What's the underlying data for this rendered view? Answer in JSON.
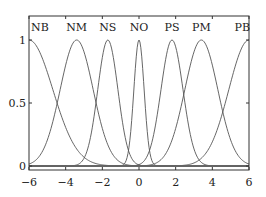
{
  "chart_data": {
    "type": "line",
    "title": "",
    "xlabel": "",
    "ylabel": "",
    "xlim": [
      -6,
      6
    ],
    "ylim": [
      0,
      1.07
    ],
    "grid": false,
    "legend": "none",
    "x_ticks": [
      -6,
      -4,
      -2,
      0,
      2,
      4,
      6
    ],
    "x_tick_labels": [
      "−6",
      "−4",
      "−2",
      "0",
      "2",
      "4",
      "6"
    ],
    "y_ticks": [
      0,
      0.5,
      1
    ],
    "y_tick_labels": [
      "0",
      "0.5",
      "1"
    ],
    "line_color": "#555555",
    "series": [
      {
        "name": "NB",
        "center": -6.0,
        "sigma": 1.3
      },
      {
        "name": "NM",
        "center": -3.4,
        "sigma": 0.9
      },
      {
        "name": "NS",
        "center": -1.7,
        "sigma": 0.55
      },
      {
        "name": "NO",
        "center": 0.0,
        "sigma": 0.28
      },
      {
        "name": "PS",
        "center": 1.8,
        "sigma": 0.6
      },
      {
        "name": "PM",
        "center": 3.4,
        "sigma": 0.9
      },
      {
        "name": "PB",
        "center": 6.0,
        "sigma": 1.1
      }
    ],
    "top_labels": [
      {
        "text": "NB",
        "x": -6.0
      },
      {
        "text": "NM",
        "x": -3.4
      },
      {
        "text": "NS",
        "x": -1.7
      },
      {
        "text": "NO",
        "x": 0.0
      },
      {
        "text": "PS",
        "x": 1.8
      },
      {
        "text": "PM",
        "x": 3.4
      },
      {
        "text": "PB",
        "x": 6.0
      }
    ]
  }
}
